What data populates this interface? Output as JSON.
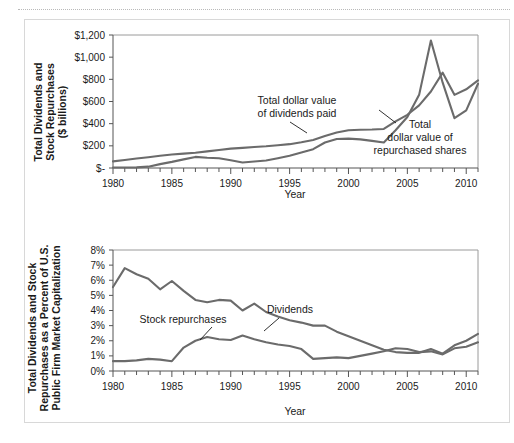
{
  "figure": {
    "background_color": "#ffffff",
    "line_color": "#6b6b6b",
    "axis_color": "#555555"
  },
  "chart_data": [
    {
      "type": "line",
      "panel": "top",
      "title": "",
      "xlabel": "Year",
      "ylabel": "Total Dividends and Stock Repurchases ($ billions)",
      "ylabel_line1": "Total Dividends and",
      "ylabel_line2": "Stock Repurchases",
      "ylabel_line3": "($ billions)",
      "xlim": [
        1980,
        2011
      ],
      "ylim": [
        0,
        1200
      ],
      "grid": false,
      "legend_position": "none",
      "y_ticks": [
        0,
        200,
        400,
        600,
        800,
        1000,
        1200
      ],
      "y_tick_labels": [
        "$-",
        "$200",
        "$400",
        "$600",
        "$800",
        "$1,000",
        "$1,200"
      ],
      "x_ticks": [
        1980,
        1985,
        1990,
        1995,
        2000,
        2005,
        2010
      ],
      "x_tick_labels": [
        "1980",
        "1985",
        "1990",
        "1995",
        "2000",
        "2005",
        "2010"
      ],
      "x": [
        1980,
        1981,
        1982,
        1983,
        1984,
        1985,
        1986,
        1987,
        1988,
        1989,
        1990,
        1991,
        1992,
        1993,
        1994,
        1995,
        1996,
        1997,
        1998,
        1999,
        2000,
        2001,
        2002,
        2003,
        2004,
        2005,
        2006,
        2007,
        2008,
        2009,
        2010,
        2011
      ],
      "series": [
        {
          "name": "Total dollar value of dividends paid",
          "values": [
            60,
            72,
            85,
            97,
            110,
            122,
            130,
            138,
            150,
            163,
            175,
            182,
            190,
            196,
            205,
            215,
            232,
            252,
            288,
            320,
            340,
            345,
            347,
            352,
            420,
            480,
            565,
            690,
            860,
            660,
            710,
            790
          ]
        },
        {
          "name": "Total dollar value of repurchased shares",
          "values": [
            5,
            5,
            6,
            12,
            35,
            55,
            78,
            100,
            92,
            88,
            70,
            50,
            58,
            68,
            88,
            110,
            140,
            170,
            230,
            262,
            265,
            258,
            245,
            230,
            340,
            460,
            660,
            1150,
            770,
            450,
            520,
            760
          ]
        }
      ],
      "annotations": [
        {
          "text_line1": "Total dollar value",
          "text_line2": "of dividends paid"
        },
        {
          "text_line1": "Total",
          "text_line2": "dollar value of",
          "text_line3": "repurchased shares"
        }
      ]
    },
    {
      "type": "line",
      "panel": "bottom",
      "title": "",
      "xlabel": "Year",
      "ylabel": "Total Dividends and Stock Repurchases as a Percent of U.S. Public Firm Market Capitalization",
      "ylabel_line1": "Total Dividends and Stock",
      "ylabel_line2": "Repurchases as a Percent of U.S.",
      "ylabel_line3": "Public Firm Market Capitalization",
      "xlim": [
        1980,
        2011
      ],
      "ylim": [
        0,
        8
      ],
      "grid": false,
      "legend_position": "none",
      "y_ticks": [
        0,
        1,
        2,
        3,
        4,
        5,
        6,
        7,
        8
      ],
      "y_tick_labels": [
        "0%",
        "1%",
        "2%",
        "3%",
        "4%",
        "5%",
        "6%",
        "7%",
        "8%"
      ],
      "x_ticks": [
        1980,
        1985,
        1990,
        1995,
        2000,
        2005,
        2010
      ],
      "x_tick_labels": [
        "1980",
        "1985",
        "1990",
        "1995",
        "2000",
        "2005",
        "2010"
      ],
      "x": [
        1980,
        1981,
        1982,
        1983,
        1984,
        1985,
        1986,
        1987,
        1988,
        1989,
        1990,
        1991,
        1992,
        1993,
        1994,
        1995,
        1996,
        1997,
        1998,
        1999,
        2000,
        2001,
        2002,
        2003,
        2004,
        2005,
        2006,
        2007,
        2008,
        2009,
        2010,
        2011
      ],
      "series": [
        {
          "name": "Dividends",
          "values": [
            5.55,
            6.8,
            6.4,
            6.1,
            5.4,
            5.95,
            5.3,
            4.7,
            4.55,
            4.7,
            4.65,
            4.0,
            4.45,
            3.9,
            3.6,
            3.35,
            3.2,
            3.0,
            3.0,
            2.6,
            2.3,
            2.0,
            1.7,
            1.4,
            1.25,
            1.2,
            1.2,
            1.45,
            1.15,
            1.7,
            2.0,
            2.45
          ]
        },
        {
          "name": "Stock repurchases",
          "values": [
            0.65,
            0.65,
            0.7,
            0.8,
            0.75,
            0.65,
            1.55,
            2.0,
            2.25,
            2.1,
            2.05,
            2.35,
            2.1,
            1.9,
            1.75,
            1.65,
            1.45,
            0.8,
            0.85,
            0.9,
            0.85,
            1.0,
            1.15,
            1.3,
            1.5,
            1.45,
            1.25,
            1.3,
            1.1,
            1.5,
            1.6,
            1.9
          ]
        },
        {
          "name": "Dividends-late-extension",
          "values": [
            null,
            null,
            null,
            null,
            null,
            null,
            null,
            null,
            null,
            null,
            null,
            null,
            null,
            null,
            null,
            null,
            null,
            null,
            null,
            null,
            null,
            null,
            null,
            null,
            1.4,
            1.55,
            1.45,
            1.8,
            2.25,
            2.4,
            2.35,
            2.7
          ]
        },
        {
          "name": "Repurchases-late-extension",
          "values": [
            null,
            null,
            null,
            null,
            null,
            null,
            null,
            null,
            null,
            null,
            null,
            null,
            null,
            null,
            null,
            null,
            null,
            null,
            null,
            null,
            null,
            null,
            null,
            null,
            2.2,
            2.1,
            2.2,
            2.2,
            2.45,
            2.65,
            3.25,
            3.6
          ]
        }
      ],
      "annotations": [
        {
          "text": "Dividends"
        },
        {
          "text": "Stock repurchases"
        }
      ]
    }
  ]
}
